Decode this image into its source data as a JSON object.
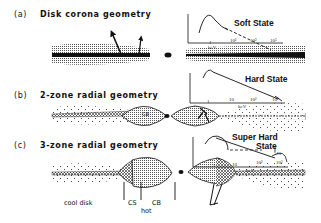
{
  "panels": [
    {
      "id": "a",
      "label": "(a)",
      "title": "Disk corona geometry",
      "state": "Soft State",
      "spectrum_ticks": [
        "1",
        "10¹",
        "10²",
        "10³"
      ],
      "axis_unit": "keV"
    },
    {
      "id": "b",
      "label": "(b)",
      "title": "2-zone radial geometry",
      "state": "Hard State",
      "region_label": "CB",
      "spectrum_ticks": [
        "1",
        "10",
        "10²",
        "10³"
      ],
      "axis_unit": "keV"
    },
    {
      "id": "c",
      "label": "(c)",
      "title": "3-zone radial geometry",
      "state_line1": "Super Hard",
      "state_line2": "State",
      "line_label": "511",
      "spectrum_ticks": [
        "1",
        "10",
        "10²",
        "10³"
      ],
      "axis_unit": "keV",
      "zone_labels": {
        "cool": "cool disk",
        "cs": "CS",
        "cb": "CB",
        "hot": "hot"
      }
    }
  ],
  "colors": {
    "ink": "#111111",
    "stipple": "#9a9a9a",
    "background": "#ffffff"
  }
}
